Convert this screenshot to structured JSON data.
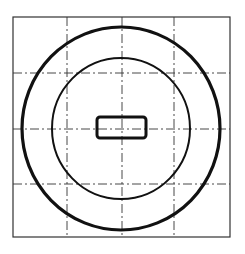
{
  "diagram": {
    "colors": {
      "background": "#ffffff",
      "stroke": "#111111",
      "grid": "#333333"
    },
    "frame": {
      "x": 13,
      "y": 17,
      "width": 217,
      "height": 220
    },
    "grid": {
      "vertical_lines_x": [
        67,
        122,
        174
      ],
      "horizontal_lines_y": [
        73,
        129,
        184
      ],
      "style": "dash-dot"
    },
    "center": {
      "x": 121,
      "y": 128.5
    },
    "outer_circle": {
      "rx": 99,
      "ry": 101.5,
      "stroke_width": 3.2
    },
    "inner_circle": {
      "rx": 69,
      "ry": 70.5,
      "stroke_width": 2
    },
    "slot": {
      "x": 97,
      "y": 117,
      "width": 49,
      "height": 21,
      "corner_radius": 3,
      "stroke_width": 3
    }
  }
}
